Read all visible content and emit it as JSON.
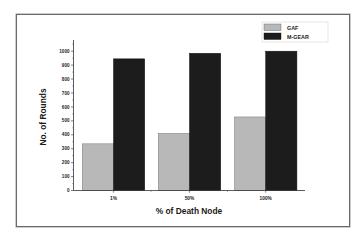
{
  "chart_data": {
    "type": "bar",
    "title": "",
    "xlabel": "% of Death Node",
    "ylabel": "No. of Rounds",
    "categories": [
      "1%",
      "50%",
      "100%"
    ],
    "series": [
      {
        "name": "GAF",
        "values": [
          335,
          410,
          528
        ],
        "color": "#b8b8b8"
      },
      {
        "name": "M-GEAR",
        "values": [
          945,
          985,
          1000
        ],
        "color": "#1c1c1c"
      }
    ],
    "ylim": [
      0,
      1100
    ],
    "yticks": [
      0,
      100,
      200,
      300,
      400,
      500,
      600,
      700,
      800,
      900,
      1000
    ],
    "grid": false,
    "legend_position": "upper right"
  },
  "legend": {
    "items": [
      {
        "label": "GAF",
        "color": "#b8b8b8"
      },
      {
        "label": "M-GEAR",
        "color": "#1c1c1c"
      }
    ]
  },
  "axes": {
    "x_title": "% of Death Node",
    "y_title": "No. of Rounds",
    "x_ticks": [
      "1%",
      "50%",
      "100%"
    ],
    "y_ticks": [
      "0",
      "100",
      "200",
      "300",
      "400",
      "500",
      "600",
      "700",
      "800",
      "900",
      "1000"
    ]
  }
}
